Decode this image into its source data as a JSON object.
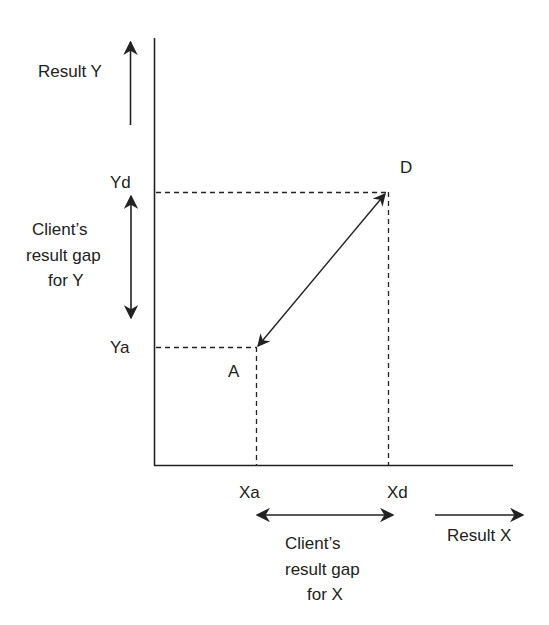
{
  "diagram": {
    "labels": {
      "result_y": "Result Y",
      "yd": "Yd",
      "ya": "Ya",
      "gap_y_line1": "Client’s",
      "gap_y_line2": "result gap",
      "gap_y_line3": "for Y",
      "point_d": "D",
      "point_a": "A",
      "xa": "Xa",
      "xd": "Xd",
      "gap_x_line1": "Client’s",
      "gap_x_line2": "result gap",
      "gap_x_line3": "for X",
      "result_x": "Result X"
    },
    "points": {
      "A": {
        "x": "Xa",
        "y": "Ya"
      },
      "D": {
        "x": "Xd",
        "y": "Yd"
      }
    },
    "colors": {
      "stroke": "#222222",
      "background": "#ffffff"
    }
  }
}
